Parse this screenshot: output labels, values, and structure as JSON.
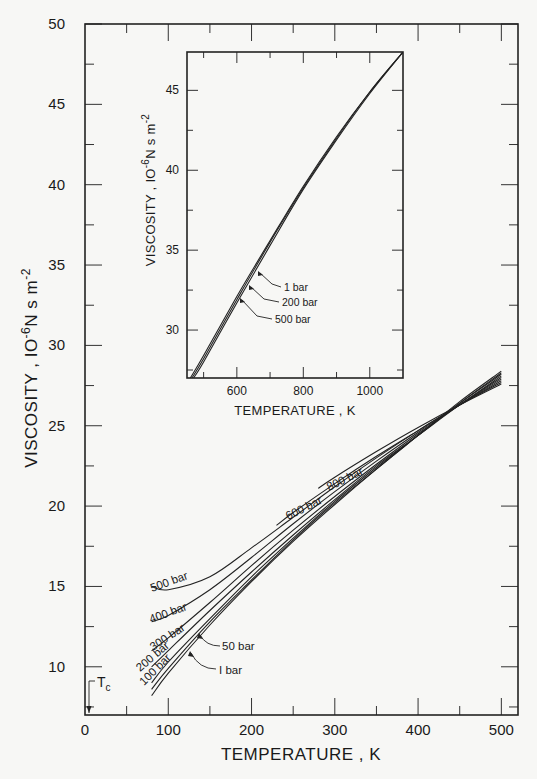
{
  "chart_data": [
    {
      "id": "main",
      "type": "line",
      "title": "",
      "xlabel": "TEMPERATURE , K",
      "ylabel": "VISCOSITY , 10^-6 N s m^-2",
      "ylabel_parts": {
        "main": "VISCOSITY , IO",
        "exp1": "-6",
        "mid": "N s m",
        "exp2": "-2"
      },
      "xlim": [
        0,
        520
      ],
      "ylim": [
        7,
        50
      ],
      "grid": false,
      "x_ticks_major": [
        0,
        100,
        200,
        300,
        400,
        500
      ],
      "x_ticks_minor": [
        50,
        150,
        250,
        350,
        450
      ],
      "x_tick_labels": [
        "0",
        "100",
        "200",
        "300",
        "400",
        "500"
      ],
      "y_ticks_major": [
        10,
        15,
        20,
        25,
        30,
        35,
        40,
        45,
        50
      ],
      "y_ticks_minor": [
        7.5,
        12.5,
        17.5,
        22.5,
        27.5,
        32.5,
        37.5,
        42.5,
        47.5
      ],
      "y_tick_labels": [
        "10",
        "15",
        "20",
        "25",
        "30",
        "35",
        "40",
        "45",
        "50"
      ],
      "annotations": [
        {
          "text": "T",
          "subscript": "c",
          "x": 5.2,
          "note": "critical temperature marker"
        }
      ],
      "series": [
        {
          "name": "1 bar",
          "label": "I bar",
          "x": [
            80,
            100,
            150,
            200,
            250,
            300,
            350,
            400,
            450,
            500
          ],
          "y": [
            8.2,
            9.6,
            12.6,
            15.3,
            17.8,
            20.1,
            22.3,
            24.4,
            26.5,
            28.4
          ]
        },
        {
          "name": "50 bar",
          "label": "50 bar",
          "x": [
            80,
            100,
            150,
            200,
            250,
            300,
            350,
            400,
            450,
            500
          ],
          "y": [
            8.6,
            9.9,
            12.8,
            15.4,
            17.9,
            20.2,
            22.3,
            24.4,
            26.4,
            28.3
          ]
        },
        {
          "name": "100 bar",
          "label": "100 bar",
          "x": [
            80,
            100,
            150,
            200,
            250,
            300,
            350,
            400,
            450,
            500
          ],
          "y": [
            9.0,
            10.3,
            13.0,
            15.6,
            18.0,
            20.3,
            22.4,
            24.4,
            26.4,
            28.2
          ]
        },
        {
          "name": "200 bar",
          "label": "200 bar",
          "x": [
            80,
            100,
            150,
            200,
            250,
            300,
            350,
            400,
            450,
            500
          ],
          "y": [
            10.0,
            11.0,
            13.5,
            15.9,
            18.2,
            20.4,
            22.5,
            24.4,
            26.3,
            28.1
          ]
        },
        {
          "name": "300 bar",
          "label": "300 bar",
          "x": [
            80,
            100,
            150,
            200,
            250,
            300,
            350,
            400,
            450,
            500
          ],
          "y": [
            11.0,
            11.8,
            14.0,
            16.3,
            18.5,
            20.6,
            22.6,
            24.5,
            26.3,
            28.0
          ]
        },
        {
          "name": "400 bar",
          "label": "400 bar",
          "x": [
            80,
            100,
            150,
            200,
            250,
            300,
            350,
            400,
            450,
            500
          ],
          "y": [
            12.8,
            13.2,
            14.8,
            16.8,
            18.9,
            20.9,
            22.8,
            24.6,
            26.3,
            27.9
          ]
        },
        {
          "name": "500 bar",
          "label": "500 bar",
          "x": [
            80,
            100,
            150,
            200,
            250,
            300,
            350,
            400,
            450,
            500
          ],
          "y": [
            15.0,
            14.8,
            15.6,
            17.4,
            19.3,
            21.2,
            23.0,
            24.7,
            26.3,
            27.8
          ]
        },
        {
          "name": "600 bar",
          "label": "600 bar",
          "x": [
            230,
            250,
            300,
            350,
            400,
            450,
            500
          ],
          "y": [
            18.8,
            19.6,
            21.4,
            23.1,
            24.7,
            26.3,
            27.7
          ]
        },
        {
          "name": "800 bar",
          "label": "800 bar",
          "x": [
            280,
            300,
            350,
            400,
            450,
            500
          ],
          "y": [
            21.1,
            21.8,
            23.4,
            24.9,
            26.3,
            27.6
          ]
        }
      ]
    },
    {
      "id": "inset",
      "type": "line",
      "title": "",
      "xlabel": "TEMPERATURE , K",
      "ylabel": "VISCOSITY , 10^-6 N s m^-2",
      "ylabel_parts": {
        "main": "VISCOSITY , IO",
        "exp1": "-6",
        "mid": "N s m",
        "exp2": "-2"
      },
      "xlim": [
        450,
        1100
      ],
      "ylim": [
        27,
        47.4
      ],
      "grid": false,
      "x_ticks_major": [
        600,
        800,
        1000
      ],
      "x_ticks_minor": [
        500,
        700,
        900
      ],
      "x_tick_labels": [
        "600",
        "800",
        "1000"
      ],
      "y_ticks_major": [
        30,
        35,
        40,
        45
      ],
      "y_ticks_minor": [
        27.5,
        32.5,
        37.5,
        42.5
      ],
      "y_tick_labels": [
        "30",
        "35",
        "40",
        "45"
      ],
      "series": [
        {
          "name": "1 bar",
          "label": "1 bar",
          "x": [
            460,
            500,
            600,
            700,
            800,
            900,
            1000,
            1100
          ],
          "y": [
            27.0,
            28.4,
            32.1,
            35.6,
            39.0,
            42.1,
            44.9,
            47.4
          ]
        },
        {
          "name": "200 bar",
          "label": "200 bar",
          "x": [
            465,
            500,
            600,
            700,
            800,
            900,
            1000,
            1100
          ],
          "y": [
            27.0,
            28.2,
            31.9,
            35.5,
            38.9,
            42.0,
            44.9,
            47.4
          ]
        },
        {
          "name": "500 bar",
          "label": "500 bar",
          "x": [
            470,
            500,
            600,
            700,
            800,
            900,
            1000,
            1100
          ],
          "y": [
            27.0,
            28.0,
            31.7,
            35.3,
            38.8,
            41.9,
            44.8,
            47.4
          ]
        }
      ]
    }
  ]
}
